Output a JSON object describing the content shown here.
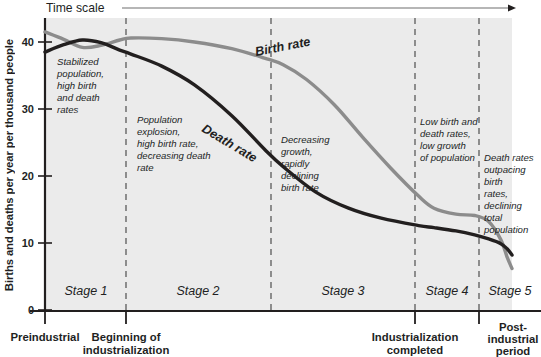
{
  "axes": {
    "y_label": "Births and deaths per year per thousand people",
    "y_ticks": [
      "0",
      "10",
      "20",
      "30",
      "40"
    ],
    "time_scale_label": "Time scale"
  },
  "stages": [
    {
      "name": "Stage 1",
      "annotation": "Stabilized population, high birth and death rates"
    },
    {
      "name": "Stage 2",
      "annotation": "Population explosion, high birth rate, decreasing death rate"
    },
    {
      "name": "Stage 3",
      "annotation": "Decreasing growth, rapidly declining birth rate"
    },
    {
      "name": "Stage 4",
      "annotation": "Low birth and death rates, low growth of population"
    },
    {
      "name": "Stage 5",
      "annotation": "Death rates outpacing birth rates, declining total population"
    }
  ],
  "annotation_lines": {
    "stage1": [
      "Stabilized",
      "population,",
      "high birth",
      "and death",
      "rates"
    ],
    "stage2": [
      "Population",
      "explosion,",
      "high birth rate,",
      "decreasing death",
      "rate"
    ],
    "stage3": [
      "Decreasing",
      "growth,",
      "rapidly",
      "declining",
      "birth rate"
    ],
    "stage4": [
      "Low birth and",
      "death rates,",
      "low growth",
      "of population"
    ],
    "stage5": [
      "Death rates",
      "outpacing",
      "birth",
      "rates,",
      "declining",
      "total",
      "population"
    ]
  },
  "x_captions": [
    {
      "label": "Preindustrial",
      "lines": [
        "Preindustrial"
      ]
    },
    {
      "label": "Beginning of industrialization",
      "lines": [
        "Beginning of",
        "industrialization"
      ]
    },
    {
      "label": "Industrialization completed",
      "lines": [
        "Industrialization",
        "completed"
      ]
    },
    {
      "label": "Post-industrial period",
      "lines": [
        "Post-",
        "industrial",
        "period"
      ]
    }
  ],
  "curve_labels": {
    "birth": "Birth rate",
    "death": "Death rate"
  },
  "colors": {
    "birth_rate": "#8c8c8c",
    "death_rate": "#221f1f",
    "plot_background": "#ebebeb",
    "divider": "#8c8c8c",
    "axis": "#221f1f"
  },
  "chart_data": {
    "type": "line",
    "xlabel": "Time scale",
    "ylabel": "Births and deaths per year per thousand people",
    "ylim": [
      0,
      45
    ],
    "yticks": [
      0,
      10,
      20,
      30,
      40
    ],
    "grid": false,
    "legend": "inline-curve-labels",
    "stage_boundaries_x_pct": [
      0,
      18.4,
      51.0,
      83.3,
      97.6,
      100
    ],
    "series": [
      {
        "name": "Birth rate",
        "color": "#8c8c8c",
        "x_pct": [
          0,
          4,
          8,
          12,
          16,
          18.4,
          25,
          32,
          40,
          47,
          51,
          56,
          62,
          68,
          74,
          80,
          83.3,
          88,
          92,
          95,
          97.6,
          99,
          100
        ],
        "values": [
          41.5,
          40.4,
          39.2,
          39.5,
          40.3,
          40.6,
          40.5,
          40.0,
          39.0,
          37.6,
          36.6,
          34.4,
          30.6,
          25.8,
          21.2,
          17.0,
          15.2,
          14.3,
          14.1,
          13.2,
          10.5,
          7.8,
          6.2
        ]
      },
      {
        "name": "Death rate",
        "color": "#221f1f",
        "x_pct": [
          0,
          4,
          8,
          12,
          16,
          18.4,
          25,
          32,
          40,
          47,
          51,
          58,
          65,
          72,
          80,
          83.3,
          88,
          92,
          95,
          97.6,
          99,
          100
        ],
        "values": [
          38.5,
          39.6,
          40.3,
          39.9,
          38.8,
          38.2,
          36.4,
          33.6,
          29.0,
          24.0,
          21.4,
          17.6,
          15.2,
          13.7,
          12.6,
          12.3,
          11.8,
          11.2,
          10.6,
          9.9,
          9.1,
          8.2
        ]
      }
    ]
  }
}
